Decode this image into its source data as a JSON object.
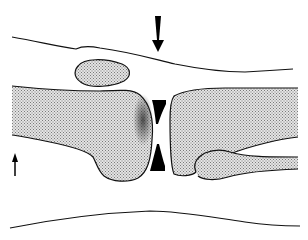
{
  "diagram": {
    "colors": {
      "background": "#ffffff",
      "outline": "#111111",
      "stipple": "#9a9a9a",
      "fill_light": "#d6d6d6",
      "wedge": "#000000"
    },
    "elements": [
      {
        "name": "skin-outline-top",
        "type": "contour"
      },
      {
        "name": "skin-outline-bottom",
        "type": "contour"
      },
      {
        "name": "patella",
        "type": "bone"
      },
      {
        "name": "femur",
        "type": "bone"
      },
      {
        "name": "tibia",
        "type": "bone"
      },
      {
        "name": "fibula",
        "type": "bone"
      },
      {
        "name": "joint-space-wedges",
        "type": "marker"
      },
      {
        "name": "force-arrow-down",
        "type": "arrow",
        "direction": "down"
      },
      {
        "name": "force-arrow-up",
        "type": "arrow",
        "direction": "up"
      }
    ]
  }
}
